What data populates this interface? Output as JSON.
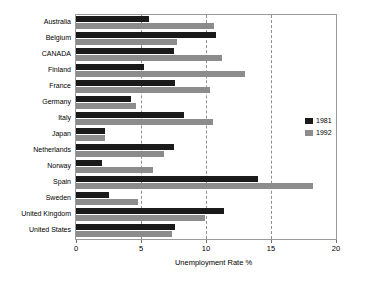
{
  "chart_data": {
    "type": "bar",
    "orientation": "horizontal",
    "title": "",
    "xlabel": "Unemployment Rate %",
    "ylabel": "",
    "xlim": [
      0,
      20
    ],
    "xticks": [
      0,
      5,
      10,
      15,
      20
    ],
    "xtick_labels": [
      "0",
      "5",
      "10",
      "15",
      "20"
    ],
    "gridlines": [
      5,
      10,
      15
    ],
    "grid": true,
    "grid_style": "dashed",
    "legend_position": "right",
    "categories": [
      "Australia",
      "Belgium",
      "CANADA",
      "Finland",
      "France",
      "Germany",
      "Italy",
      "Japan",
      "Netherlands",
      "Norway",
      "Spain",
      "Sweden",
      "United Kingdom",
      "United States"
    ],
    "series": [
      {
        "name": "1981",
        "color": "#1a1a1a",
        "values": [
          5.6,
          10.8,
          7.5,
          5.2,
          7.6,
          4.2,
          8.3,
          2.2,
          7.5,
          2.0,
          14.0,
          2.5,
          11.4,
          7.6
        ]
      },
      {
        "name": "1992",
        "color": "#8c8c8c",
        "values": [
          10.6,
          7.8,
          11.2,
          13.0,
          10.3,
          4.6,
          10.5,
          2.2,
          6.8,
          5.9,
          18.2,
          4.8,
          9.9,
          7.4
        ]
      }
    ]
  },
  "colors": {
    "series_1981": "#1a1a1a",
    "series_1992": "#8c8c8c",
    "grid": "#8f8f8f",
    "frame": "#9a9a9a",
    "background": "#ffffff"
  }
}
